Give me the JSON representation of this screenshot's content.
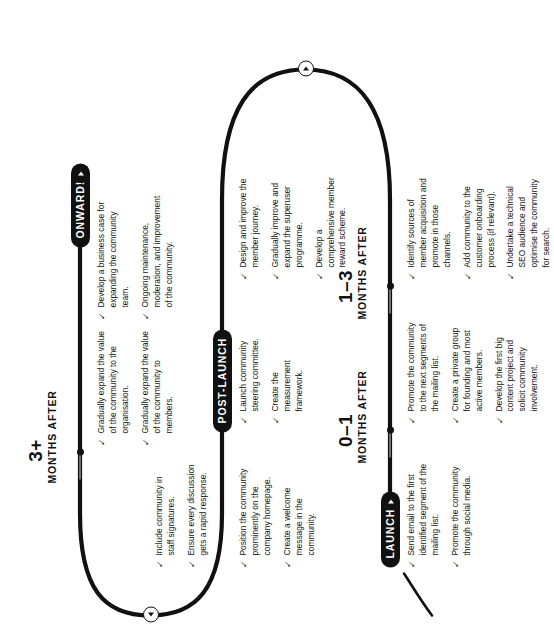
{
  "document": {
    "type": "community-launch-roadmap-timeline",
    "orientation": "rotated-90-ccw"
  },
  "stages": [
    {
      "id": "launch",
      "badge": "LAUNCH",
      "badge_icon": "play-triangle-icon",
      "period_number": "",
      "period_unit": "",
      "tasks": [
        "Send email to the first identified segment of the mailing list.",
        "Promote the community through social media."
      ]
    },
    {
      "id": "months-0-1",
      "badge": "",
      "badge_icon": "",
      "period_number": "0–1",
      "period_unit": "MONTHS AFTER",
      "tasks": [
        "Promote the community to the next segments of the mailing list.",
        "Create a private group for founding and most active members.",
        "Develop the first big content project and solicit community involvement."
      ]
    },
    {
      "id": "post-launch",
      "badge": "POST-LAUNCH",
      "badge_icon": "",
      "period_number": "",
      "period_unit": "",
      "tasks": [
        "Position the community prominently on the company homepage.",
        "Create a welcome message in the community."
      ]
    },
    {
      "id": "post-launch-b",
      "badge": "",
      "badge_icon": "",
      "period_number": "",
      "period_unit": "",
      "tasks": [
        "Launch community steering committee.",
        "Create the measurement framework."
      ]
    },
    {
      "id": "post-launch-c",
      "badge": "",
      "badge_icon": "",
      "period_number": "",
      "period_unit": "",
      "tasks": [
        "Include community in staff signatures.",
        "Ensure every discussion gets a rapid response."
      ]
    },
    {
      "id": "months-1-3",
      "badge": "",
      "badge_icon": "",
      "period_number": "1–3",
      "period_unit": "MONTHS AFTER",
      "tasks": [
        "Identify sources of member acquisition and promote in those channels.",
        "Add community to the customer onboarding process (if relevant).",
        "Undertake a technical SEO audience and optimise the community for search."
      ]
    },
    {
      "id": "months-1-3-b",
      "badge": "",
      "badge_icon": "",
      "period_number": "",
      "period_unit": "",
      "tasks": [
        "Design and improve the member journey.",
        "Gradually improve and expand the superuser programme.",
        "Develop a comprehensive member reward scheme."
      ]
    },
    {
      "id": "months-3-plus",
      "badge": "ONWARD!",
      "badge_icon": "play-triangle-icon",
      "period_number": "3+",
      "period_unit": "MONTHS AFTER",
      "tasks": [
        "Gradually expand the value of the community to the organisation.",
        "Gradually expand the value of the community to members.",
        "Develop a business case for expanding the community team.",
        "Ongoing maintenance, moderation, and improvement of the community."
      ]
    }
  ],
  "colors": {
    "ink": "#111111",
    "paper": "#ffffff",
    "tick_line": "#6f6f6f"
  },
  "glyphs": {
    "check": "✓",
    "triangle": "▶"
  }
}
